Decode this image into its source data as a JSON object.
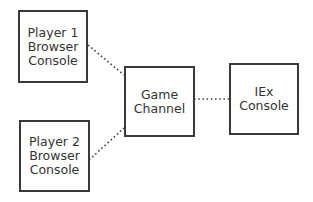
{
  "diagram": {
    "nodes": [
      {
        "id": "player1",
        "lines": [
          "Player 1",
          "Browser",
          "Console"
        ]
      },
      {
        "id": "player2",
        "lines": [
          "Player 2",
          "Browser",
          "Console"
        ]
      },
      {
        "id": "game_channel",
        "lines": [
          "Game",
          "Channel"
        ]
      },
      {
        "id": "iex",
        "lines": [
          "IEx",
          "Console"
        ]
      }
    ],
    "edges": [
      {
        "from": "player1",
        "to": "game_channel",
        "style": "dotted"
      },
      {
        "from": "player2",
        "to": "game_channel",
        "style": "dotted"
      },
      {
        "from": "game_channel",
        "to": "iex",
        "style": "dotted"
      }
    ],
    "colors": {
      "border": "#3a3a3a",
      "text": "#333333",
      "line": "#444444"
    }
  }
}
